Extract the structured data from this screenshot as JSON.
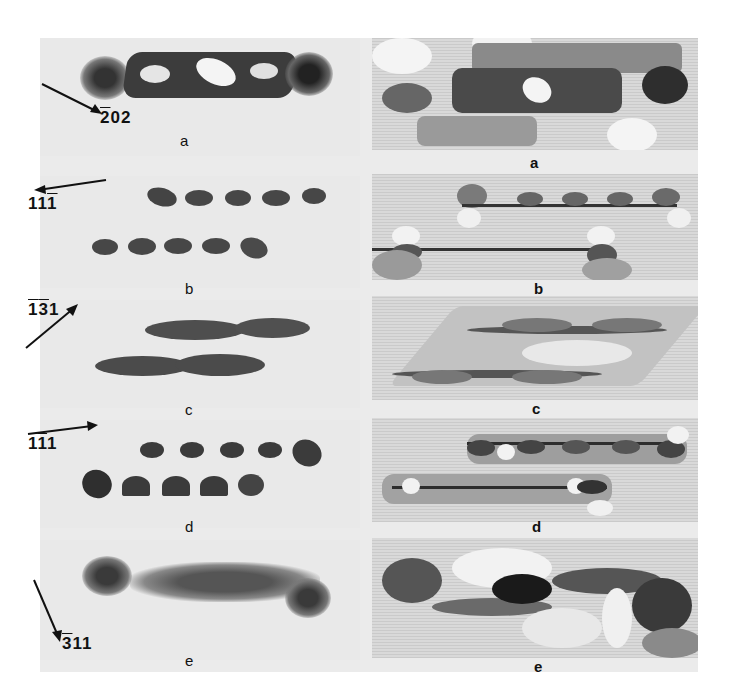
{
  "figure": {
    "rows": [
      {
        "panel_label_left": "a",
        "panel_label_right": "a",
        "direction": {
          "h": "2",
          "k": "0",
          "l": "2",
          "bars": [
            true,
            false,
            false
          ],
          "text": "̅2 0 2"
        }
      },
      {
        "panel_label_left": "b",
        "panel_label_right": "b",
        "direction": {
          "text": "1 1 ̅1",
          "bars": [
            false,
            false,
            true
          ]
        }
      },
      {
        "panel_label_left": "c",
        "panel_label_right": "c",
        "direction": {
          "text": "̅1 ̅3 1",
          "bars": [
            true,
            true,
            false
          ]
        }
      },
      {
        "panel_label_left": "d",
        "panel_label_right": "d",
        "direction": {
          "text": "̅1 ̅1 1",
          "bars": [
            true,
            true,
            false
          ]
        }
      },
      {
        "panel_label_left": "e",
        "panel_label_right": "e",
        "direction": {
          "text": "̅3 1 1",
          "bars": [
            true,
            false,
            false
          ]
        }
      }
    ],
    "miller": {
      "a": [
        "2",
        "0",
        "2"
      ],
      "b": [
        "1",
        "1",
        "1"
      ],
      "c": [
        "1",
        "3",
        "1"
      ],
      "d": [
        "1",
        "1",
        "1"
      ],
      "e": [
        "3",
        "1",
        "1"
      ]
    },
    "columns": {
      "left": "experimental micrographs",
      "right": "simulated images"
    }
  }
}
